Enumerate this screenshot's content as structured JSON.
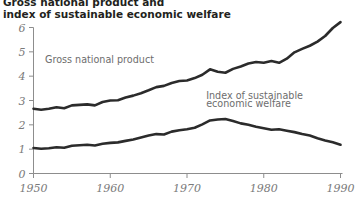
{
  "title": {
    "line1": "Gross national product and",
    "line2": "index of sustainable economic welfare"
  },
  "chart_data": {
    "type": "line",
    "title": "Gross national product and index of sustainable economic welfare",
    "xlabel": "",
    "ylabel": "",
    "xlim": [
      1950,
      1990
    ],
    "ylim": [
      0,
      6
    ],
    "grid": false,
    "legend_position": "inline-annotation",
    "x_ticks": [
      "1950",
      "1960",
      "1970",
      "1980",
      "1990"
    ],
    "x_tick_values": [
      1950,
      1960,
      1970,
      1980,
      1990
    ],
    "y_ticks": [
      "0",
      "1",
      "2",
      "3",
      "4",
      "5",
      "6"
    ],
    "y_tick_values": [
      0,
      1,
      2,
      3,
      4,
      5,
      6
    ],
    "x": [
      1950,
      1951,
      1952,
      1953,
      1954,
      1955,
      1956,
      1957,
      1958,
      1959,
      1960,
      1961,
      1962,
      1963,
      1964,
      1965,
      1966,
      1967,
      1968,
      1969,
      1970,
      1971,
      1972,
      1973,
      1974,
      1975,
      1976,
      1977,
      1978,
      1979,
      1980,
      1981,
      1982,
      1983,
      1984,
      1985,
      1986,
      1987,
      1988,
      1989,
      1990
    ],
    "series": [
      {
        "name": "Gross national product",
        "color": "#2b2b2b",
        "values": [
          2.66,
          2.62,
          2.66,
          2.72,
          2.68,
          2.8,
          2.82,
          2.84,
          2.8,
          2.94,
          3.0,
          3.01,
          3.12,
          3.2,
          3.3,
          3.42,
          3.55,
          3.6,
          3.72,
          3.8,
          3.82,
          3.92,
          4.06,
          4.28,
          4.18,
          4.14,
          4.3,
          4.4,
          4.52,
          4.58,
          4.55,
          4.62,
          4.55,
          4.72,
          4.98,
          5.12,
          5.25,
          5.42,
          5.65,
          5.98,
          6.22
        ]
      },
      {
        "name": "Index of sustainable economic welfare",
        "color": "#2b2b2b",
        "values": [
          1.05,
          1.02,
          1.04,
          1.08,
          1.06,
          1.14,
          1.16,
          1.18,
          1.15,
          1.22,
          1.26,
          1.28,
          1.34,
          1.4,
          1.48,
          1.56,
          1.62,
          1.6,
          1.72,
          1.78,
          1.82,
          1.88,
          2.02,
          2.18,
          2.22,
          2.24,
          2.16,
          2.06,
          2.0,
          1.92,
          1.86,
          1.8,
          1.82,
          1.76,
          1.7,
          1.62,
          1.56,
          1.45,
          1.36,
          1.28,
          1.18
        ]
      }
    ],
    "annotations": [
      {
        "text": "Gross national product",
        "x": 1951.5,
        "y": 4.55
      },
      {
        "text": "Index of sustainable",
        "x": 1972.5,
        "y": 3.05
      },
      {
        "text": "economic welfare",
        "x": 1972.5,
        "y": 2.72
      }
    ]
  },
  "series_labels": {
    "gnp": "Gross national product",
    "isew_line1": "Index of sustainable",
    "isew_line2": "economic welfare"
  }
}
